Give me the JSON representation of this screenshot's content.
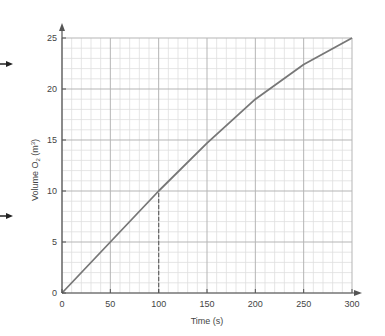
{
  "chart_data": {
    "type": "line",
    "title": "",
    "xlabel": "Time (s)",
    "ylabel": "Volume O₂ (m³)",
    "xlim": [
      0,
      300
    ],
    "ylim": [
      0,
      25
    ],
    "x_ticks": [
      0,
      50,
      100,
      150,
      200,
      250,
      300
    ],
    "y_ticks": [
      0,
      5,
      10,
      15,
      20,
      25
    ],
    "grid": true,
    "minor_grid": {
      "x_step": 10,
      "y_step": 1
    },
    "series": [
      {
        "name": "Volume O2",
        "x": [
          0,
          50,
          100,
          150,
          200,
          250,
          300
        ],
        "values": [
          0,
          5,
          10,
          14.7,
          19,
          22.4,
          25
        ]
      }
    ],
    "annotations": [
      {
        "type": "dashed-line",
        "x": 100,
        "from_y": 0,
        "to_y": 10
      }
    ],
    "margin_arrows": [
      {
        "y_pixel": 64
      },
      {
        "y_pixel": 216
      }
    ],
    "legend": null
  },
  "labels": {
    "x_axis": "Time (s)",
    "y_axis_main": "Volume O",
    "y_axis_sub": "2",
    "y_axis_unit": " (m",
    "y_axis_sup": "3",
    "y_axis_close": ")",
    "x_ticks": [
      "0",
      "50",
      "100",
      "150",
      "200",
      "250",
      "300"
    ],
    "y_ticks": [
      "0",
      "5",
      "10",
      "15",
      "20",
      "25"
    ]
  },
  "colors": {
    "line": "#777777",
    "axis": "#555555",
    "grid_major": "#b5b5b5",
    "grid_minor": "#dedede",
    "text": "#444444"
  }
}
